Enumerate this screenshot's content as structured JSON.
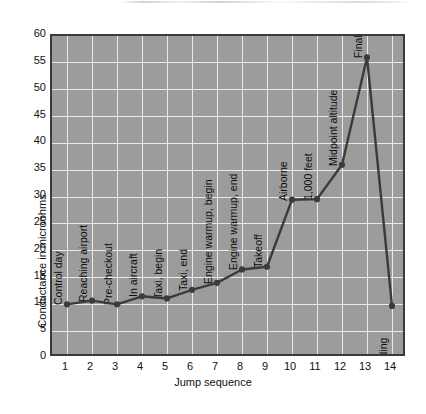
{
  "chart_data": {
    "type": "line",
    "title": "",
    "xlabel": "Jump sequence",
    "ylabel": "Conductance in microohms",
    "xlim": [
      0.4,
      14.6
    ],
    "ylim": [
      0,
      60
    ],
    "grid": true,
    "legend": "none",
    "xticklabels": [
      "1",
      "2",
      "3",
      "4",
      "5",
      "6",
      "7",
      "8",
      "9",
      "10",
      "11",
      "12",
      "13",
      "14"
    ],
    "yticklabels": [
      "0",
      "5",
      "10",
      "15",
      "20",
      "25",
      "30",
      "35",
      "40",
      "45",
      "50",
      "55",
      "60"
    ],
    "x": [
      1,
      2,
      3,
      4,
      5,
      6,
      7,
      8,
      9,
      10,
      11,
      12,
      13,
      14
    ],
    "values": [
      10,
      10.7,
      10,
      11.5,
      11.1,
      12.7,
      14,
      16.5,
      17,
      29.5,
      29.6,
      36,
      56,
      9.7
    ],
    "point_labels": [
      "Control day",
      "Reaching airport",
      "Pre-checkout",
      "In aircraft",
      "Taxi, begin",
      "Taxi, end",
      "Engine warmup, begin",
      "Engine warmup, end",
      "Takeoff",
      "Airborne",
      "1,000 feet",
      "Midpoint altitude",
      "Final altitude",
      "Landing"
    ],
    "series": [
      {
        "name": "Conductance",
        "values": [
          10,
          10.7,
          10,
          11.5,
          11.1,
          12.7,
          14,
          16.5,
          17,
          29.5,
          29.6,
          36,
          56,
          9.7
        ]
      }
    ],
    "colors": {
      "plot_background": "#9c9c9c",
      "gridline": "#e9e9e9",
      "line": "#3b3b3b",
      "marker": "#3b3b3b",
      "axis_border": "#3a3a3a",
      "text": "#111111",
      "page_background": "#ffffff"
    }
  }
}
